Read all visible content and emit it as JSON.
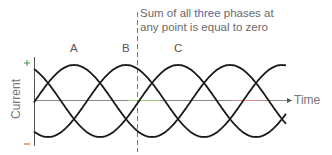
{
  "diagram": {
    "caption": {
      "line1_pre": "Sum of all ",
      "line1_highlight": "three",
      "line1_post": " phases at",
      "line2": "any point is equal to zero"
    },
    "y_axis": {
      "label": "Current",
      "plus_label": "+",
      "minus_label": "−"
    },
    "x_axis": {
      "label": "Time"
    },
    "phases": [
      {
        "name": "A",
        "peak_x": 74
      },
      {
        "name": "B",
        "peak_x": 126
      },
      {
        "name": "C",
        "peak_x": 178
      }
    ],
    "colors": {
      "curve": "#1a1a1a",
      "axis": "#777777",
      "plus": "#3a9a3a",
      "minus": "#e07030",
      "highlight": "#5a63a8",
      "text": "#6a6a6a"
    }
  }
}
